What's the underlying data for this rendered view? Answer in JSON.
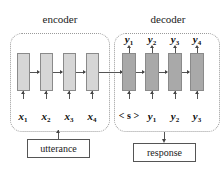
{
  "diagram": {
    "type": "seq2seq-encoder-decoder",
    "encoder": {
      "title": "encoder",
      "inputs": [
        {
          "var": "x",
          "sub": "1"
        },
        {
          "var": "x",
          "sub": "2"
        },
        {
          "var": "x",
          "sub": "3"
        },
        {
          "var": "x",
          "sub": "4"
        }
      ],
      "cell_color": "#d6d6d6"
    },
    "decoder": {
      "title": "decoder",
      "outputs": [
        {
          "var": "y",
          "sub": "1"
        },
        {
          "var": "y",
          "sub": "2"
        },
        {
          "var": "y",
          "sub": "3"
        },
        {
          "var": "y",
          "sub": "4"
        }
      ],
      "inputs": [
        {
          "label": "< s >"
        },
        {
          "var": "y",
          "sub": "1"
        },
        {
          "var": "y",
          "sub": "2"
        },
        {
          "var": "y",
          "sub": "3"
        }
      ],
      "cell_color": "#a9a9a9"
    },
    "input_box": {
      "label": "utterance"
    },
    "output_box": {
      "label": "response"
    },
    "colors": {
      "border": "#9a9a9a",
      "arrow": "#444444",
      "text": "#222222"
    }
  }
}
